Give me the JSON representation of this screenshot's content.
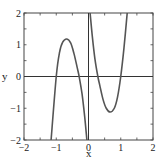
{
  "chart_data": {
    "type": "line",
    "title": "",
    "xlabel": "x",
    "ylabel": "y",
    "xlim": [
      -2,
      2
    ],
    "ylim": [
      -2,
      2
    ],
    "grid": false,
    "legend": null,
    "xticks": [
      -2,
      -1,
      0,
      1,
      2
    ],
    "yticks": [
      -2,
      -1,
      0,
      1,
      2
    ],
    "xtick_labels": [
      "−2",
      "−1",
      "0",
      "1",
      "2"
    ],
    "ytick_labels": [
      "−2",
      "−1",
      "0",
      "1",
      "2"
    ],
    "minor_tick_step": 0.5,
    "reference_lines": [
      {
        "orientation": "horizontal",
        "value": 0
      },
      {
        "orientation": "vertical",
        "value": 0
      }
    ],
    "series": [
      {
        "name": "f(x)",
        "color": "#555555",
        "description": "odd function with vertical asymptote at x=0; zeros near x=±1 and x=±0.29; local max ~1.18 at x≈-0.67; local min ~-1.12 at x≈0.67",
        "points_left_branch": [
          [
            -1.16,
            -2.0
          ],
          [
            -1.0,
            0.0
          ],
          [
            -0.9,
            0.75
          ],
          [
            -0.8,
            1.08
          ],
          [
            -0.67,
            1.18
          ],
          [
            -0.55,
            1.05
          ],
          [
            -0.45,
            0.72
          ],
          [
            -0.35,
            0.28
          ],
          [
            -0.29,
            0.0
          ],
          [
            -0.2,
            -0.55
          ],
          [
            -0.12,
            -1.25
          ],
          [
            -0.05,
            -2.0
          ]
        ],
        "points_right_branch": [
          [
            0.05,
            2.0
          ],
          [
            0.12,
            1.25
          ],
          [
            0.2,
            0.55
          ],
          [
            0.29,
            0.0
          ],
          [
            0.35,
            -0.28
          ],
          [
            0.45,
            -0.72
          ],
          [
            0.55,
            -1.0
          ],
          [
            0.67,
            -1.12
          ],
          [
            0.8,
            -1.0
          ],
          [
            0.9,
            -0.65
          ],
          [
            1.0,
            0.0
          ],
          [
            1.1,
            0.9
          ],
          [
            1.2,
            2.0
          ]
        ]
      }
    ]
  },
  "plot": {
    "box": {
      "left": 24,
      "top": 13,
      "right": 153,
      "bottom": 140
    },
    "colors": {
      "axis": "#333333",
      "curve": "#555555",
      "frame": "#444444"
    }
  }
}
